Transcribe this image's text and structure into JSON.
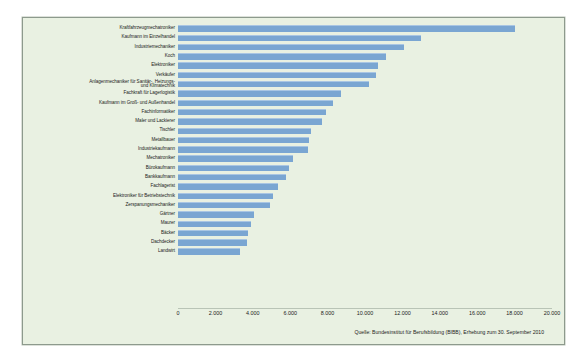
{
  "chart_data": {
    "type": "bar",
    "orientation": "horizontal",
    "title": "",
    "xlabel": "",
    "ylabel": "",
    "xlim": [
      0,
      20000
    ],
    "grid": false,
    "legend": null,
    "source_note": "Quelle: Bundesinstitut für Berufsbildung (BIBB), Erhebung zum 30. September 2010",
    "xticks": [
      "0",
      "2.000",
      "4.000",
      "6.000",
      "8.000",
      "10.000",
      "12.000",
      "14.000",
      "16.000",
      "18.000",
      "20.000"
    ],
    "xtick_values": [
      0,
      2000,
      4000,
      6000,
      8000,
      10000,
      12000,
      14000,
      16000,
      18000,
      20000
    ],
    "categories": [
      "Kraftfahrzeugmechatroniker",
      "Kaufmann im Einzelhandel",
      "Industriemechaniker",
      "Koch",
      "Elektroniker",
      "Verkäufer",
      "Anlagenmechaniker für Sanitär-, Heizungs-\nund Klimatechnik",
      "Fachkraft für Lagerlogistik",
      "Kaufmann im Groß- und Außenhandel",
      "Fachinformatiker",
      "Maler und Lackierer",
      "Tischler",
      "Metallbauer",
      "Industriekaufmann",
      "Mechatroniker",
      "Bürokaufmann",
      "Bankkaufmann",
      "Fachlagerist",
      "Elektroniker für Betriebstechnik",
      "Zerspanungsmechaniker",
      "Gärtner",
      "Maurer",
      "Bäcker",
      "Dachdecker",
      "Landwirt"
    ],
    "values": [
      18000,
      13000,
      12100,
      11100,
      10700,
      10600,
      10200,
      8700,
      8300,
      7900,
      7700,
      7100,
      7000,
      6950,
      6150,
      5950,
      5800,
      5350,
      5100,
      4900,
      4050,
      3900,
      3750,
      3700,
      3300
    ]
  },
  "colors": {
    "bar": "#7aa6d2",
    "bar_highlight": "#a9c6e3",
    "panel_background": "#e9f1e2",
    "panel_border": "#8d9a8d",
    "page_background": "#ffffff",
    "text": "#1b1b1b"
  }
}
